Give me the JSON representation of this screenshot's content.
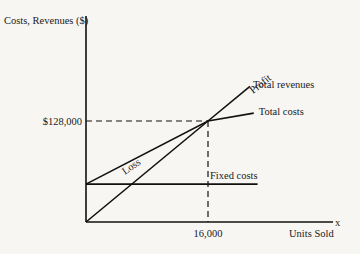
{
  "chart_data": {
    "type": "line",
    "title": "",
    "ylabel": "Costs, Revenues ($)",
    "xlabel": "Units Sold",
    "x_axis_symbol": "x",
    "xlim": [
      0,
      23000
    ],
    "ylim": [
      0,
      230000
    ],
    "grid": false,
    "x_ticks": [
      {
        "value": 16000,
        "label": "16,000"
      }
    ],
    "y_ticks": [
      {
        "value": 128000,
        "label": "$128,000"
      }
    ],
    "series": [
      {
        "name": "Total revenues",
        "points": [
          [
            0,
            0
          ],
          [
            16000,
            128000
          ],
          [
            21500,
            172000
          ]
        ]
      },
      {
        "name": "Total costs",
        "points": [
          [
            0,
            48000
          ],
          [
            16000,
            128000
          ],
          [
            22000,
            138000
          ]
        ]
      },
      {
        "name": "Fixed costs",
        "points": [
          [
            0,
            48000
          ],
          [
            22500,
            48000
          ]
        ]
      }
    ],
    "break_even": {
      "units": 16000,
      "amount": 128000
    },
    "annotations": [
      {
        "text": "Loss",
        "region": "below break-even between total costs and total revenues"
      },
      {
        "text": "Profit",
        "region": "above break-even between total revenues and total costs"
      }
    ]
  }
}
